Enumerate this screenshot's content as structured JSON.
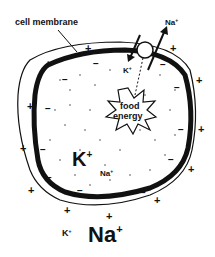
{
  "labels": {
    "cell_membrane": "cell membrane",
    "na_out_top": "Na",
    "k_in_top": "K",
    "food": "food",
    "energy": "energy",
    "k_inside": "K",
    "na_inside": "Na",
    "k_outside": "K",
    "na_outside": "Na",
    "plus": "+",
    "minus": "−"
  },
  "colors": {
    "ink": "#111111",
    "background": "#ffffff"
  }
}
